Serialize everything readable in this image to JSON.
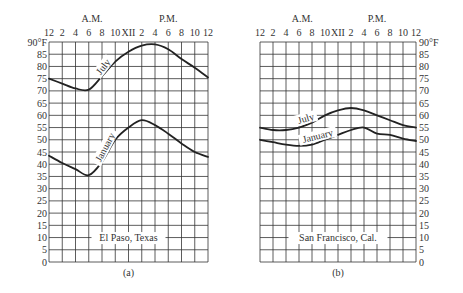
{
  "chart_data": [
    {
      "type": "line",
      "panel": "(a)",
      "title": "El Paso, Texas",
      "xlabel_groups": [
        "A.M.",
        "P.M."
      ],
      "x_tick_labels": [
        "12",
        "2",
        "4",
        "6",
        "8",
        "10",
        "XII",
        "2",
        "4",
        "6",
        "8",
        "10",
        "12"
      ],
      "x_hours": [
        0,
        2,
        4,
        6,
        8,
        10,
        12,
        14,
        16,
        18,
        20,
        22,
        24
      ],
      "y_tick_labels": [
        "90°F",
        "85",
        "80",
        "75",
        "70",
        "65",
        "60",
        "55",
        "50",
        "45",
        "40",
        "35",
        "30",
        "25",
        "20",
        "15",
        "10",
        "5",
        "0"
      ],
      "ylim": [
        0,
        90
      ],
      "y_axis_side": "left",
      "grid": true,
      "series": [
        {
          "name": "July",
          "values": [
            75,
            73,
            71,
            70.5,
            76,
            82,
            86,
            88.5,
            89,
            87,
            83,
            79.5,
            75.5
          ]
        },
        {
          "name": "January",
          "values": [
            43.5,
            40.5,
            38,
            35.5,
            41,
            50,
            55,
            58,
            56,
            52.5,
            48.5,
            45,
            43
          ]
        }
      ]
    },
    {
      "type": "line",
      "panel": "(b)",
      "title": "San Francisco, Cal.",
      "xlabel_groups": [
        "A.M.",
        "P.M."
      ],
      "x_tick_labels": [
        "12",
        "2",
        "4",
        "6",
        "8",
        "10",
        "XII",
        "2",
        "4",
        "6",
        "8",
        "10",
        "12"
      ],
      "x_hours": [
        0,
        2,
        4,
        6,
        8,
        10,
        12,
        14,
        16,
        18,
        20,
        22,
        24
      ],
      "y_tick_labels": [
        "90°F",
        "85",
        "80",
        "75",
        "70",
        "65",
        "60",
        "55",
        "50",
        "45",
        "40",
        "35",
        "30",
        "25",
        "20",
        "15",
        "10",
        "5",
        "0"
      ],
      "ylim": [
        0,
        90
      ],
      "y_axis_side": "right",
      "grid": true,
      "series": [
        {
          "name": "July",
          "values": [
            55,
            54,
            54,
            55,
            57,
            60,
            62,
            63,
            62,
            60,
            58,
            56,
            55
          ]
        },
        {
          "name": "January",
          "values": [
            50,
            49,
            48,
            47.5,
            48,
            50,
            52,
            54,
            55,
            52.5,
            52,
            50.5,
            49.5
          ]
        }
      ]
    }
  ],
  "labels": {
    "am": "A.M.",
    "pm": "P.M.",
    "panel_a_caption": "(a)",
    "panel_b_caption": "(b)",
    "panel_a_location": "El Paso, Texas",
    "panel_b_location": "San Francisco, Cal.",
    "july": "July",
    "january": "January"
  }
}
